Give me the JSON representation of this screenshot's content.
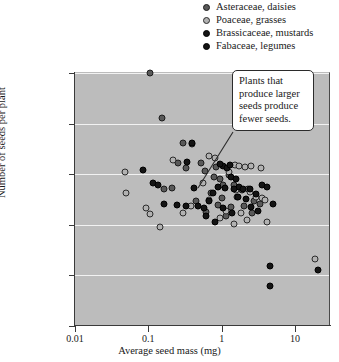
{
  "legend": {
    "items": [
      {
        "label": "Asteraceae, daisies",
        "marker": "circle-dark-gray",
        "fill": "#595959",
        "edge": "#1c1c1c"
      },
      {
        "label": "Poaceae, grasses",
        "marker": "circle-light-gray",
        "fill": "#b2b2b2",
        "edge": "#2b2b2b"
      },
      {
        "label": "Brassicaceae, mustards",
        "marker": "circle-black",
        "fill": "#141414",
        "edge": "#000000"
      },
      {
        "label": "Fabaceae, legumes",
        "marker": "circle-black",
        "fill": "#141414",
        "edge": "#000000"
      }
    ]
  },
  "annotation": {
    "text": "Plants that produce larger seeds produce fewer seeds."
  },
  "chart_data": {
    "type": "scatter",
    "title": "",
    "xlabel": "Average seed mass (mg)",
    "ylabel": "Number of seeds per plant",
    "xscale": "log",
    "yscale": "log",
    "xlim": [
      0.01,
      30
    ],
    "ylim": [
      10,
      1000000
    ],
    "xticks": [
      0.01,
      0.1,
      1,
      10
    ],
    "xtick_labels": [
      "0.01",
      "0.1",
      "1",
      "10"
    ],
    "yticks": [
      10,
      100,
      1000,
      10000,
      100000,
      1000000
    ],
    "ytick_labels": [
      "10",
      "100",
      "1,000",
      "10,000",
      "100,000",
      "1,000,000"
    ],
    "grid": "horizontal",
    "plot_bgcolor": "#bcbcbc",
    "gridcolor": "#f2f2f2",
    "legend_position": "above-right",
    "annotation_text": "Plants that produce larger seeds produce fewer seeds.",
    "series": [
      {
        "name": "Asteraceae, daisies",
        "fill": "#595959",
        "edge": "#1c1c1c",
        "points": [
          [
            0.105,
            1000000
          ],
          [
            0.155,
            130000
          ],
          [
            0.3,
            42000
          ],
          [
            0.4,
            40000
          ],
          [
            0.25,
            17000
          ],
          [
            0.33,
            13000
          ],
          [
            0.165,
            5200
          ],
          [
            0.21,
            5400
          ],
          [
            0.52,
            17000
          ],
          [
            0.6,
            11500
          ],
          [
            0.78,
            9000
          ],
          [
            0.95,
            8000
          ],
          [
            1.25,
            9500
          ],
          [
            1.05,
            6000
          ],
          [
            1.45,
            6200
          ],
          [
            0.72,
            4200
          ],
          [
            1.0,
            3400
          ],
          [
            1.6,
            3500
          ],
          [
            1.9,
            4800
          ],
          [
            2.3,
            5200
          ],
          [
            0.9,
            2500
          ],
          [
            1.35,
            2200
          ],
          [
            2.0,
            2400
          ],
          [
            2.8,
            3000
          ],
          [
            3.3,
            2600
          ],
          [
            0.62,
            1800
          ],
          [
            1.15,
            1500
          ],
          [
            2.6,
            1750
          ],
          [
            0.45,
            3000
          ],
          [
            0.85,
            14000
          ]
        ]
      },
      {
        "name": "Poaceae, grasses",
        "fill": "#b2b2b2",
        "edge": "#2b2b2b",
        "points": [
          [
            0.048,
            11000
          ],
          [
            0.05,
            4200
          ],
          [
            0.093,
            2100
          ],
          [
            0.215,
            19000
          ],
          [
            0.145,
            900
          ],
          [
            0.68,
            23000
          ],
          [
            0.8,
            21000
          ],
          [
            0.55,
            6800
          ],
          [
            0.68,
            3100
          ],
          [
            1.5,
            15500
          ],
          [
            1.75,
            14500
          ],
          [
            2.1,
            14000
          ],
          [
            2.55,
            14500
          ],
          [
            3.4,
            13000
          ],
          [
            1.25,
            11000
          ],
          [
            1.55,
            4800
          ],
          [
            2.4,
            4400
          ],
          [
            2.9,
            3600
          ],
          [
            3.6,
            3400
          ],
          [
            3.9,
            3100
          ],
          [
            1.15,
            1900
          ],
          [
            1.85,
            1700
          ],
          [
            2.2,
            1250
          ],
          [
            1.45,
            1050
          ],
          [
            4.1,
            1150
          ],
          [
            0.95,
            1350
          ],
          [
            19.0,
            210
          ],
          [
            0.38,
            2400
          ],
          [
            0.3,
            1700
          ],
          [
            0.105,
            1650
          ]
        ]
      },
      {
        "name": "Brassicaceae, mustards",
        "fill": "#141414",
        "edge": "#000000",
        "points": [
          [
            0.085,
            12000
          ],
          [
            0.115,
            6600
          ],
          [
            0.135,
            6200
          ],
          [
            0.39,
            42000
          ],
          [
            0.34,
            17500
          ],
          [
            0.165,
            2600
          ],
          [
            0.245,
            2500
          ],
          [
            0.33,
            2350
          ],
          [
            0.48,
            2400
          ],
          [
            0.42,
            5300
          ],
          [
            0.57,
            2100
          ],
          [
            0.75,
            4300
          ],
          [
            0.9,
            5600
          ],
          [
            1.05,
            14500
          ],
          [
            1.2,
            13500
          ],
          [
            1.35,
            9000
          ],
          [
            1.55,
            8200
          ],
          [
            1.7,
            5600
          ],
          [
            0.62,
            1500
          ],
          [
            0.8,
            1150
          ]
        ]
      },
      {
        "name": "Fabaceae, legumes",
        "fill": "#141414",
        "edge": "#000000",
        "points": [
          [
            0.95,
            16000
          ],
          [
            1.3,
            15000
          ],
          [
            1.1,
            5400
          ],
          [
            1.45,
            5100
          ],
          [
            1.95,
            5000
          ],
          [
            2.45,
            5100
          ],
          [
            2.9,
            4100
          ],
          [
            1.65,
            3500
          ],
          [
            2.15,
            3200
          ],
          [
            1.05,
            2150
          ],
          [
            1.4,
            1700
          ],
          [
            2.5,
            2200
          ],
          [
            3.6,
            6000
          ],
          [
            4.2,
            5500
          ],
          [
            4.6,
            150
          ],
          [
            4.5,
            62
          ],
          [
            20.5,
            130
          ],
          [
            3.1,
            1900
          ],
          [
            0.68,
            2900
          ],
          [
            5.0,
            2600
          ]
        ]
      }
    ]
  }
}
